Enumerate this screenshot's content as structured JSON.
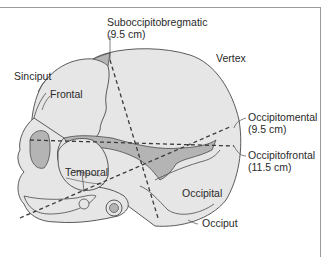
{
  "figure": {
    "colors": {
      "skull_fill": "#e6e6e6",
      "shaded_fill": "#b4b4b4",
      "outline": "#4a4a4a",
      "frame": "#9a9a9a"
    }
  },
  "labels": {
    "suboccipitobregmatic": {
      "name": "Suboccipitobregmatic",
      "measure": "(9.5 cm)"
    },
    "vertex": "Vertex",
    "sinciput": "Sinciput",
    "frontal": "Frontal",
    "occipitomental": {
      "name": "Occipitomental",
      "measure": "(9.5 cm)"
    },
    "occipitofrontal": {
      "name": "Occipitofrontal",
      "measure": "(11.5 cm)"
    },
    "temporal": "Temporal",
    "occipital": "Occipital",
    "occiput": "Occiput"
  }
}
